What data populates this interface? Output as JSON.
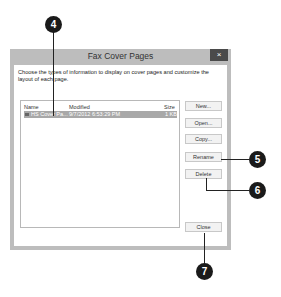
{
  "dialog": {
    "title": "Fax Cover Pages",
    "close_label": "×",
    "description": "Choose the types of information to display on cover pages and customize the layout of each page.",
    "list": {
      "columns": [
        "Name",
        "Modified",
        "Size"
      ],
      "rows": [
        {
          "name": "HS Cover Pa...",
          "modified": "9/7/2012 6:53:29 PM",
          "size": "1 KB",
          "selected": true
        }
      ]
    },
    "buttons": {
      "new": "New...",
      "open": "Open...",
      "copy": "Copy...",
      "rename": "Rename",
      "delete": "Delete",
      "close": "Close"
    }
  },
  "callouts": [
    "4",
    "5",
    "6",
    "7"
  ]
}
